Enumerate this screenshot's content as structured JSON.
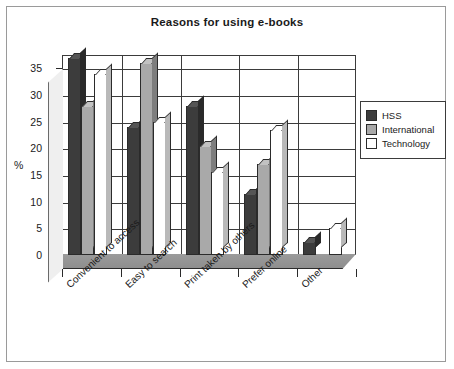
{
  "chart_data": {
    "type": "bar",
    "title": "Reasons for using e-books",
    "xlabel": "",
    "ylabel": "%",
    "ylim": [
      0,
      37.5
    ],
    "yticks": [
      0,
      5,
      10,
      15,
      20,
      25,
      30,
      35
    ],
    "grid": true,
    "legend_position": "right",
    "style": "3d-clustered-column",
    "categories": [
      "Convenient to access",
      "Easy to search",
      "Print taken by others",
      "Prefer online",
      "Other"
    ],
    "series": [
      {
        "name": "HSS",
        "color": "#3c3c3c",
        "values": [
          37,
          24,
          28,
          11.5,
          2.5
        ]
      },
      {
        "name": "International",
        "color": "#a9a9a9",
        "values": [
          28,
          36,
          20.5,
          17,
          0
        ]
      },
      {
        "name": "Technology",
        "color": "#ffffff",
        "values": [
          34,
          25,
          15.5,
          23.5,
          5
        ]
      }
    ]
  },
  "axis": {
    "y_label": "%",
    "y_tick_labels": [
      "35",
      "30",
      "25",
      "20",
      "15",
      "10",
      "5",
      "0"
    ]
  },
  "legend": {
    "items": [
      {
        "label": "HSS",
        "color": "#3c3c3c"
      },
      {
        "label": "International",
        "color": "#a9a9a9"
      },
      {
        "label": "Technology",
        "color": "#ffffff"
      }
    ]
  },
  "colors": {
    "frame": "#9a9a9a",
    "axis": "#3b3b3b",
    "text": "#1a1a1a",
    "background": "#ffffff"
  }
}
